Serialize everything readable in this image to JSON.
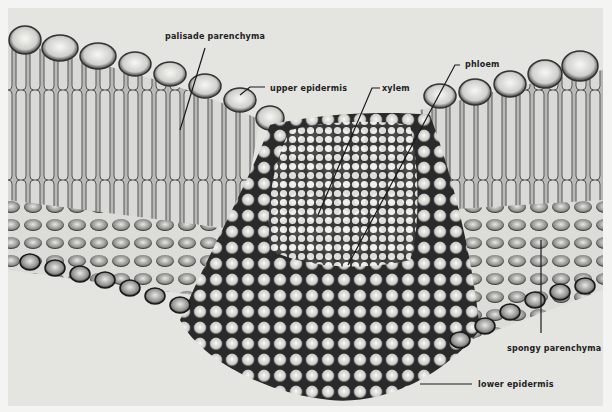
{
  "figure": {
    "labels": [
      {
        "id": "palisade",
        "text": "palisade parenchyma",
        "x": 165,
        "y": 32
      },
      {
        "id": "upper-epidermis",
        "text": "upper epidermis",
        "x": 270,
        "y": 84
      },
      {
        "id": "xylem",
        "text": "xylem",
        "x": 382,
        "y": 84
      },
      {
        "id": "phloem",
        "text": "phloem",
        "x": 465,
        "y": 60
      },
      {
        "id": "spongy",
        "text": "spongy parenchyma",
        "x": 507,
        "y": 344
      },
      {
        "id": "lower-epidermis",
        "text": "lower epidermis",
        "x": 478,
        "y": 380
      }
    ]
  }
}
